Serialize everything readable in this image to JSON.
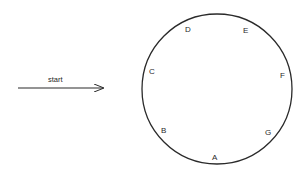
{
  "diagram": {
    "start_label": "start",
    "nodes": [
      {
        "id": "A",
        "label": "A"
      },
      {
        "id": "B",
        "label": "B"
      },
      {
        "id": "C",
        "label": "C"
      },
      {
        "id": "D",
        "label": "D"
      },
      {
        "id": "E",
        "label": "E"
      },
      {
        "id": "F",
        "label": "F"
      },
      {
        "id": "G",
        "label": "G"
      }
    ],
    "colors": {
      "stroke": "#2a2a2a",
      "text": "#2a2a2a",
      "background": "#ffffff"
    }
  }
}
